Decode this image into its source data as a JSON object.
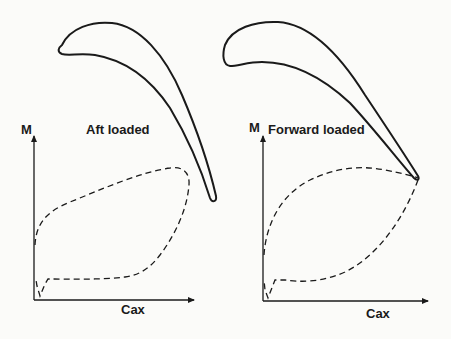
{
  "figure": {
    "panels": [
      {
        "id": "aft",
        "title": "Aft loaded",
        "y_axis_label": "M",
        "x_axis_label": "Cax",
        "curves": [
          "suction-surface-mach (upper dashed)",
          "pressure-surface-mach (lower dashed)"
        ],
        "peak_location": "aft (near trailing edge)"
      },
      {
        "id": "forward",
        "title": "Forward loaded",
        "y_axis_label": "M",
        "x_axis_label": "Cax",
        "curves": [
          "suction-surface-mach (upper dashed)",
          "pressure-surface-mach (lower dashed)"
        ],
        "peak_location": "forward (mid-chord)"
      }
    ],
    "colors": {
      "line": "#1a1a1a",
      "background": "#fbfbf9"
    }
  }
}
